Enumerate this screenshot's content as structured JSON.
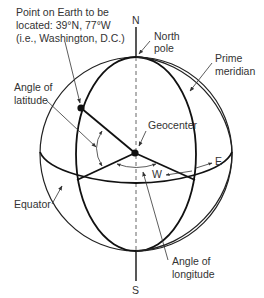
{
  "diagram": {
    "labels": {
      "point_line1": "Point on Earth to be",
      "point_line2": "located: 39°N, 77°W",
      "point_line3": "(i.e., Washington, D.C.)",
      "north": "N",
      "south": "S",
      "north_pole_line1": "North",
      "north_pole_line2": "pole",
      "prime_meridian_line1": "Prime",
      "prime_meridian_line2": "meridian",
      "latitude_line1": "Angle of",
      "latitude_line2": "latitude",
      "geocenter": "Geocenter",
      "east": "E",
      "west": "W",
      "equator": "Equator",
      "longitude_line1": "Angle of",
      "longitude_line2": "longitude"
    },
    "point": {
      "latitude": "39°N",
      "longitude": "77°W",
      "place": "Washington, D.C."
    },
    "colors": {
      "line": "#111111",
      "text": "#333333",
      "background": "#ffffff"
    }
  }
}
